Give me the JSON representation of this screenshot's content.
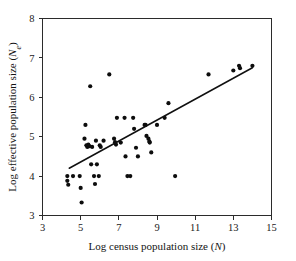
{
  "chart_data": {
    "type": "scatter",
    "title": "",
    "xlabel": "Log census population size (N)",
    "ylabel": "Log effective population size (Ne)",
    "xlabel_parts": {
      "text": "Log census population size (",
      "symbol": "N",
      "tail": ")"
    },
    "ylabel_parts": {
      "text": "Log effective population size (",
      "symbol": "N",
      "subscript": "e",
      "tail": ")"
    },
    "xlim": [
      3,
      15
    ],
    "ylim": [
      3,
      8
    ],
    "xticks": [
      3,
      5,
      7,
      9,
      11,
      13,
      15
    ],
    "yticks": [
      3,
      4,
      5,
      6,
      7,
      8
    ],
    "xtick_labels": [
      "3",
      "5",
      "7",
      "9",
      "11",
      "13",
      "15"
    ],
    "ytick_labels": [
      "3",
      "4",
      "5",
      "6",
      "7",
      "8"
    ],
    "grid": false,
    "legend": false,
    "marker": "filled-circle",
    "marker_color": "#0d0d0d",
    "line_color": "#101010",
    "trendline": {
      "x": [
        4.4,
        14.0
      ],
      "y": [
        4.2,
        6.75
      ]
    },
    "points": [
      [
        4.3,
        4.0
      ],
      [
        4.3,
        3.88
      ],
      [
        4.35,
        3.78
      ],
      [
        4.6,
        4.0
      ],
      [
        4.95,
        4.0
      ],
      [
        5.0,
        3.7
      ],
      [
        5.05,
        3.33
      ],
      [
        5.2,
        4.95
      ],
      [
        5.25,
        5.3
      ],
      [
        5.3,
        4.78
      ],
      [
        5.35,
        4.74
      ],
      [
        5.4,
        4.8
      ],
      [
        5.45,
        4.76
      ],
      [
        5.5,
        6.28
      ],
      [
        5.55,
        4.3
      ],
      [
        5.6,
        4.74
      ],
      [
        5.7,
        4.0
      ],
      [
        5.75,
        3.8
      ],
      [
        5.8,
        4.9
      ],
      [
        5.85,
        4.3
      ],
      [
        5.95,
        4.0
      ],
      [
        6.0,
        4.78
      ],
      [
        6.05,
        4.74
      ],
      [
        6.2,
        4.9
      ],
      [
        6.5,
        6.58
      ],
      [
        6.75,
        4.95
      ],
      [
        6.8,
        4.86
      ],
      [
        6.85,
        4.8
      ],
      [
        6.9,
        5.48
      ],
      [
        7.1,
        4.85
      ],
      [
        7.3,
        5.48
      ],
      [
        7.35,
        4.5
      ],
      [
        7.45,
        4.0
      ],
      [
        7.6,
        4.0
      ],
      [
        7.75,
        5.48
      ],
      [
        7.8,
        5.2
      ],
      [
        7.9,
        4.72
      ],
      [
        8.0,
        4.5
      ],
      [
        8.35,
        5.3
      ],
      [
        8.4,
        5.3
      ],
      [
        8.45,
        5.02
      ],
      [
        8.55,
        4.95
      ],
      [
        8.6,
        4.88
      ],
      [
        8.62,
        4.85
      ],
      [
        8.7,
        4.6
      ],
      [
        9.0,
        5.3
      ],
      [
        9.4,
        5.48
      ],
      [
        9.6,
        5.85
      ],
      [
        9.95,
        4.0
      ],
      [
        11.7,
        6.58
      ],
      [
        13.0,
        6.68
      ],
      [
        13.3,
        6.8
      ],
      [
        13.35,
        6.74
      ],
      [
        14.0,
        6.8
      ]
    ]
  }
}
